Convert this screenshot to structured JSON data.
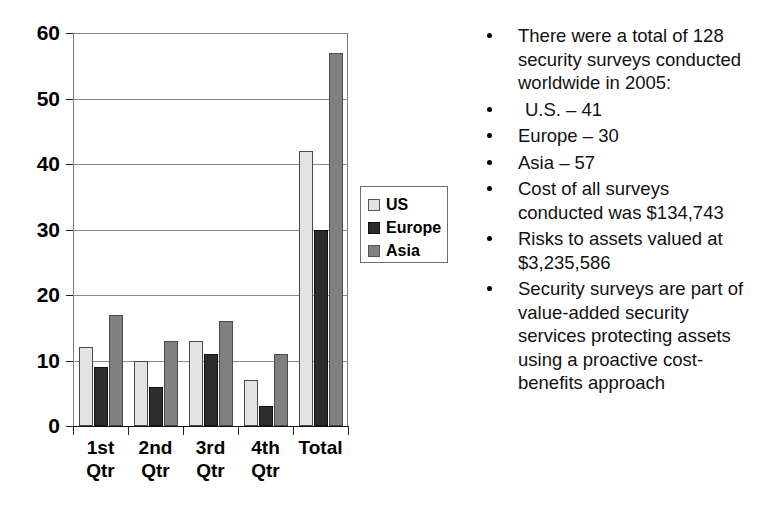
{
  "chart_data": {
    "type": "bar",
    "title": "",
    "xlabel": "",
    "ylabel": "",
    "categories": [
      "1st\nQtr",
      "2nd\nQtr",
      "3rd\nQtr",
      "4th\nQtr",
      "Total"
    ],
    "series": [
      {
        "name": "US",
        "values": [
          12,
          10,
          13,
          7,
          42
        ],
        "color": "#e3e3e3"
      },
      {
        "name": "Europe",
        "values": [
          9,
          6,
          11,
          3,
          30
        ],
        "color": "#2c2c2c"
      },
      {
        "name": "Asia",
        "values": [
          17,
          13,
          16,
          11,
          57
        ],
        "color": "#808080"
      }
    ],
    "ylim": [
      0,
      60
    ],
    "yticks": [
      0,
      10,
      20,
      30,
      40,
      50,
      60
    ],
    "ytick_labels": [
      "0",
      "10",
      "20",
      "30",
      "40",
      "50",
      "60"
    ],
    "grid": true,
    "legend_position": "right-middle",
    "legend_entries": [
      "US",
      "Europe",
      "Asia"
    ]
  },
  "legend": {
    "items": [
      {
        "label": "US"
      },
      {
        "label": "Europe"
      },
      {
        "label": "Asia"
      }
    ]
  },
  "bullets": {
    "items": [
      {
        "text": "There were a total of 128\nsecurity surveys conducted\nworldwide in 2005:",
        "indent": false
      },
      {
        "text": "U.S. – 41",
        "indent": true
      },
      {
        "text": "Europe – 30",
        "indent": false
      },
      {
        "text": "Asia – 57",
        "indent": false
      },
      {
        "text": "Cost of all surveys\nconducted was $134,743",
        "indent": false
      },
      {
        "text": "Risks to assets valued at\n$3,235,586",
        "indent": false
      },
      {
        "text": "Security surveys are part of\nvalue-added security\nservices protecting assets\nusing a proactive cost-\nbenefits approach",
        "indent": false
      }
    ]
  }
}
